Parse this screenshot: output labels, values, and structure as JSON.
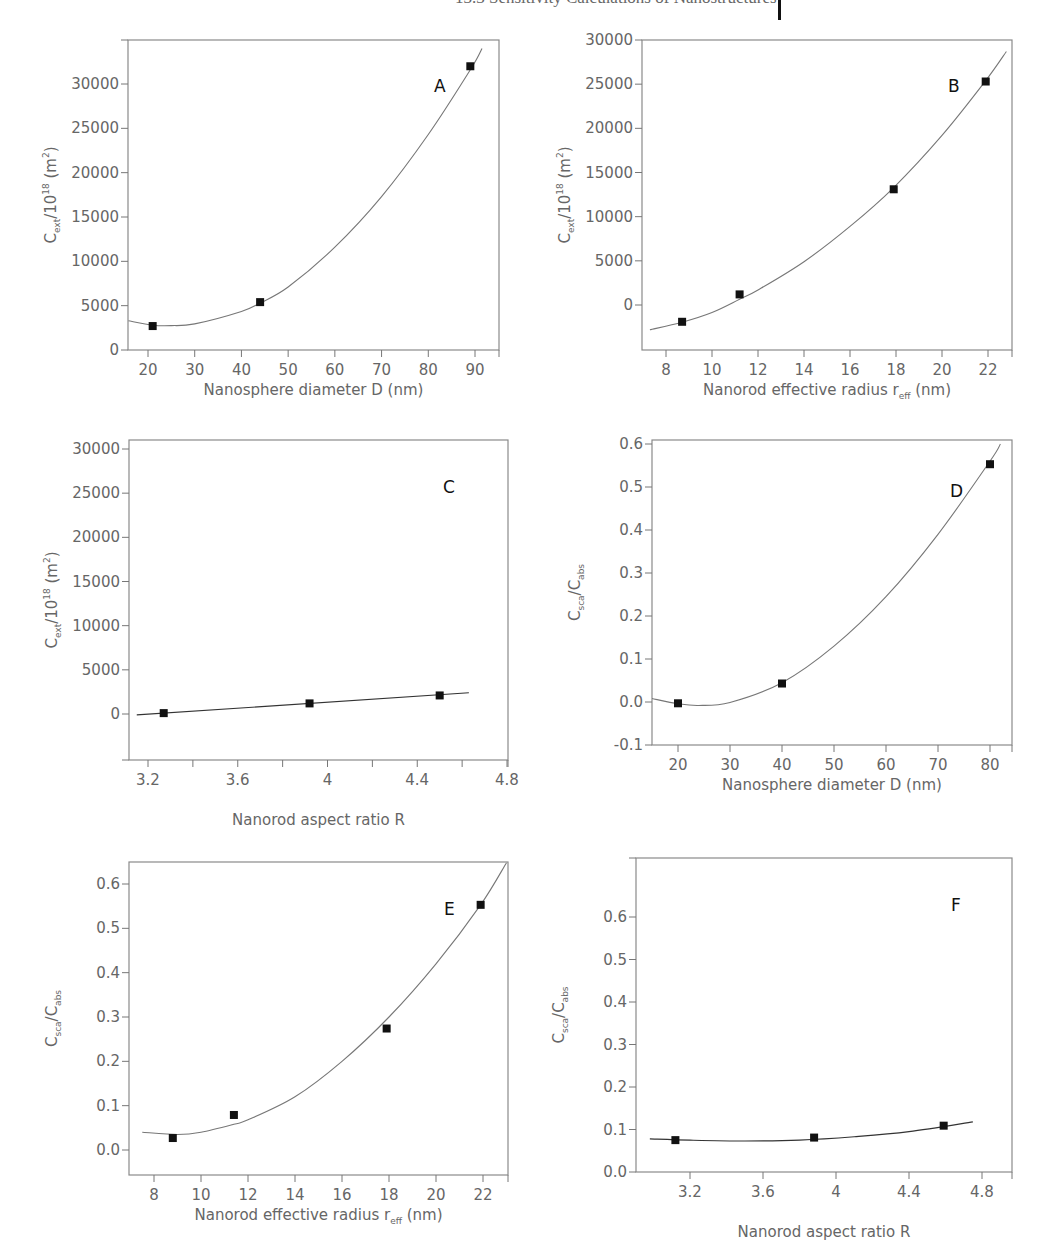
{
  "header": {
    "running_text": "13.3 Sensitivity Calculations of Nanostructures",
    "page_bar": "|"
  },
  "chart_data": [
    {
      "id": "A",
      "type": "scatter",
      "panel_label": "A",
      "xlabel": "Nanosphere diameter D (nm)",
      "ylabel": "C_ext/10^18 (m^2)",
      "ylabel_parts": {
        "main": "C",
        "sub": "ext",
        "mid": "/10",
        "sup": "18",
        "unit_open": " (m",
        "unit_sup": "2",
        "unit_close": ")"
      },
      "xlim": [
        15.8,
        95
      ],
      "ylim": [
        0,
        32900
      ],
      "xticks": [
        20,
        30,
        40,
        50,
        60,
        70,
        80,
        90
      ],
      "yticks": [
        0,
        5000,
        10000,
        15000,
        20000,
        25000,
        30000
      ],
      "extra_ytick_top": true,
      "grid": false,
      "points": [
        [
          21,
          2700
        ],
        [
          44,
          5400
        ],
        [
          89,
          32000
        ]
      ],
      "fit": {
        "kind": "poly2",
        "x_range": [
          15.8,
          91.5
        ],
        "points": [
          [
            15.8,
            3300
          ],
          [
            21,
            2800
          ],
          [
            25,
            2750
          ],
          [
            30,
            2950
          ],
          [
            40,
            4350
          ],
          [
            44,
            5300
          ],
          [
            50,
            7100
          ],
          [
            60,
            11600
          ],
          [
            70,
            17300
          ],
          [
            80,
            24300
          ],
          [
            89,
            31600
          ],
          [
            91.5,
            34000
          ]
        ]
      },
      "frame_px": {
        "left": 128,
        "top": 40,
        "right": 499,
        "bottom": 350
      },
      "map": {
        "x0": 20,
        "px0": 148,
        "x1": 90,
        "px1": 475,
        "y0": 0,
        "py0": 350,
        "y1": 30000,
        "py1": 84
      },
      "letter_pos": [
        434,
        92
      ]
    },
    {
      "id": "B",
      "type": "scatter",
      "panel_label": "B",
      "xlabel": "Nanorod effective radius r_eff (nm)",
      "xlabel_parts": {
        "main": "Nanorod effective radius r",
        "sub": "eff",
        "tail": " (nm)"
      },
      "ylabel": "C_ext/10^18 (m^2)",
      "ylabel_parts": {
        "main": "C",
        "sub": "ext",
        "mid": "/10",
        "sup": "18",
        "unit_open": " (m",
        "unit_sup": "2",
        "unit_close": ")"
      },
      "xlim": [
        7,
        23
      ],
      "ylim": [
        -5100,
        30000
      ],
      "xticks": [
        8,
        10,
        12,
        14,
        16,
        18,
        20,
        22
      ],
      "yticks": [
        0,
        5000,
        10000,
        15000,
        20000,
        25000,
        30000
      ],
      "grid": false,
      "points": [
        [
          8.7,
          -1900
        ],
        [
          11.2,
          1200
        ],
        [
          17.9,
          13100
        ],
        [
          21.9,
          25300
        ]
      ],
      "fit": {
        "kind": "poly2",
        "x_range": [
          7.3,
          22.8
        ],
        "points": [
          [
            7.3,
            -2800
          ],
          [
            8.7,
            -1950
          ],
          [
            10,
            -850
          ],
          [
            11.2,
            650
          ],
          [
            12,
            1700
          ],
          [
            14,
            4900
          ],
          [
            16,
            8900
          ],
          [
            17.9,
            13300
          ],
          [
            20,
            19200
          ],
          [
            21.9,
            25400
          ],
          [
            22.8,
            28700
          ]
        ]
      },
      "frame_px": {
        "left": 642,
        "top": 40,
        "right": 1012,
        "bottom": 350
      },
      "map": {
        "x0": 8,
        "px0": 666,
        "x1": 22,
        "px1": 988,
        "y0": 0,
        "py0": 305,
        "y1": 30000,
        "py1": 40
      },
      "letter_pos": [
        948,
        92
      ]
    },
    {
      "id": "C",
      "type": "scatter",
      "panel_label": "C",
      "xlabel": "Nanorod aspect ratio R",
      "ylabel": "C_ext/10^18 (m^2)",
      "ylabel_parts": {
        "main": "C",
        "sub": "ext",
        "mid": "/10",
        "sup": "18",
        "unit_open": " (m",
        "unit_sup": "2",
        "unit_close": ")"
      },
      "xlim": [
        3.12,
        4.8
      ],
      "ylim": [
        -5200,
        30000
      ],
      "xticks": [
        3.2,
        3.6,
        4.0,
        4.4,
        4.8
      ],
      "xticks_minor": [
        3.4,
        3.8,
        4.2,
        4.6
      ],
      "yticks": [
        0,
        5000,
        10000,
        15000,
        20000,
        25000,
        30000
      ],
      "extra_ytick_bottom": true,
      "grid": false,
      "points": [
        [
          3.27,
          100
        ],
        [
          3.92,
          1200
        ],
        [
          4.5,
          2100
        ]
      ],
      "fit": {
        "kind": "linear",
        "x_range": [
          3.15,
          4.63
        ],
        "points": [
          [
            3.15,
            -100
          ],
          [
            4.63,
            2400
          ]
        ]
      },
      "frame_px": {
        "left": 129,
        "top": 440,
        "right": 508,
        "bottom": 760
      },
      "map": {
        "x0": 3.2,
        "px0": 148,
        "x1": 4.8,
        "px1": 507,
        "y0": 0,
        "py0": 714,
        "y1": 30000,
        "py1": 449
      },
      "letter_pos": [
        443,
        493
      ]
    },
    {
      "id": "D",
      "type": "scatter",
      "panel_label": "D",
      "xlabel": "Nanosphere diameter D (nm)",
      "ylabel": "C_sca/C_abs",
      "ylabel_parts": {
        "main": "C",
        "sub": "sca",
        "mid": "/C",
        "sub2": "abs"
      },
      "xlim": [
        15,
        84
      ],
      "ylim": [
        -0.1,
        0.6
      ],
      "xticks": [
        20,
        30,
        40,
        50,
        60,
        70,
        80
      ],
      "yticks": [
        -0.1,
        0.0,
        0.1,
        0.2,
        0.3,
        0.4,
        0.5,
        0.6
      ],
      "ytick_labels": [
        "-0.1",
        "0.0",
        "0.1",
        "0.2",
        "0.3",
        "0.4",
        "0.5",
        "0.6"
      ],
      "grid": false,
      "points": [
        [
          20,
          -0.003
        ],
        [
          40,
          0.043
        ],
        [
          80,
          0.553
        ]
      ],
      "fit": {
        "kind": "poly2",
        "x_range": [
          15,
          82
        ],
        "points": [
          [
            15,
            0.008
          ],
          [
            20,
            -0.004
          ],
          [
            24,
            -0.008
          ],
          [
            30,
            -0.001
          ],
          [
            40,
            0.045
          ],
          [
            50,
            0.13
          ],
          [
            60,
            0.245
          ],
          [
            70,
            0.39
          ],
          [
            80,
            0.56
          ],
          [
            82,
            0.6
          ]
        ]
      },
      "frame_px": {
        "left": 652,
        "top": 440,
        "right": 1012,
        "bottom": 745
      },
      "map": {
        "x0": 20,
        "px0": 678,
        "x1": 80,
        "px1": 990,
        "y0": 0.0,
        "py0": 702,
        "y1": 0.6,
        "py1": 444
      },
      "letter_pos": [
        950,
        497
      ]
    },
    {
      "id": "E",
      "type": "scatter",
      "panel_label": "E",
      "xlabel": "Nanorod effective radius r_eff (nm)",
      "xlabel_parts": {
        "main": "Nanorod effective radius r",
        "sub": "eff",
        "tail": " (nm)"
      },
      "ylabel": "C_sca/C_abs",
      "ylabel_parts": {
        "main": "C",
        "sub": "sca",
        "mid": "/C",
        "sub2": "abs"
      },
      "xlim": [
        7,
        23
      ],
      "ylim": [
        -0.055,
        0.65
      ],
      "xticks": [
        8,
        10,
        12,
        14,
        16,
        18,
        20,
        22
      ],
      "yticks": [
        0.0,
        0.1,
        0.2,
        0.3,
        0.4,
        0.5,
        0.6
      ],
      "ytick_labels": [
        "0.0",
        "0.1",
        "0.2",
        "0.3",
        "0.4",
        "0.5",
        "0.6"
      ],
      "grid": false,
      "points": [
        [
          8.8,
          0.027
        ],
        [
          11.4,
          0.079
        ],
        [
          17.9,
          0.274
        ],
        [
          21.9,
          0.553
        ]
      ],
      "fit": {
        "kind": "poly2",
        "x_range": [
          7.5,
          23
        ],
        "points": [
          [
            7.5,
            0.04
          ],
          [
            9,
            0.035
          ],
          [
            10,
            0.04
          ],
          [
            11.4,
            0.058
          ],
          [
            12,
            0.068
          ],
          [
            14,
            0.12
          ],
          [
            16,
            0.2
          ],
          [
            18,
            0.3
          ],
          [
            20,
            0.42
          ],
          [
            21.9,
            0.553
          ],
          [
            23,
            0.648
          ]
        ]
      },
      "frame_px": {
        "left": 129,
        "top": 862,
        "right": 508,
        "bottom": 1175
      },
      "map": {
        "x0": 8,
        "px0": 154,
        "x1": 22,
        "px1": 483,
        "y0": 0.0,
        "py0": 1150,
        "y1": 0.6,
        "py1": 884
      },
      "letter_pos": [
        444,
        915
      ]
    },
    {
      "id": "F",
      "type": "scatter",
      "panel_label": "F",
      "xlabel": "Nanorod aspect ratio R",
      "ylabel": "C_sca/C_abs",
      "ylabel_parts": {
        "main": "C",
        "sub": "sca",
        "mid": "/C",
        "sub2": "abs"
      },
      "xlim": [
        2.9,
        5.0
      ],
      "ylim": [
        0.0,
        0.69
      ],
      "xticks": [
        3.2,
        3.6,
        4.0,
        4.4,
        4.8
      ],
      "yticks": [
        0.0,
        0.1,
        0.2,
        0.3,
        0.4,
        0.5,
        0.6
      ],
      "ytick_labels": [
        "0.0",
        "0.1",
        "0.2",
        "0.3",
        "0.4",
        "0.5",
        "0.6"
      ],
      "extra_ytick_top": true,
      "grid": false,
      "points": [
        [
          3.12,
          0.075
        ],
        [
          3.88,
          0.081
        ],
        [
          4.59,
          0.109
        ]
      ],
      "fit": {
        "kind": "poly2",
        "x_range": [
          2.98,
          4.75
        ],
        "points": [
          [
            2.98,
            0.078
          ],
          [
            3.2,
            0.075
          ],
          [
            3.5,
            0.073
          ],
          [
            3.8,
            0.075
          ],
          [
            4.1,
            0.083
          ],
          [
            4.4,
            0.095
          ],
          [
            4.75,
            0.118
          ]
        ]
      },
      "frame_px": {
        "left": 636,
        "top": 858,
        "right": 1012,
        "bottom": 1172
      },
      "map": {
        "x0": 3.2,
        "px0": 690,
        "x1": 4.8,
        "px1": 982,
        "y0": 0.0,
        "py0": 1172,
        "y1": 0.6,
        "py1": 917
      },
      "letter_pos": [
        951,
        911
      ]
    }
  ]
}
